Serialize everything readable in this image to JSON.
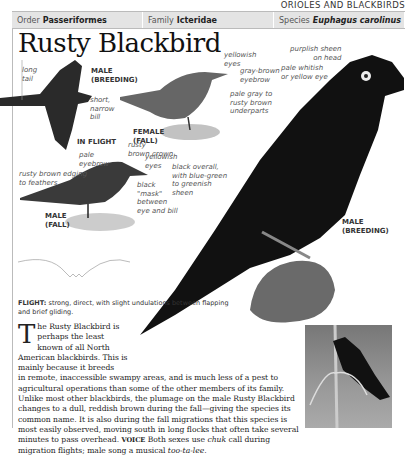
{
  "section": "ORIOLES AND BLACKBIRDS",
  "header": {
    "order_label": "Order",
    "order_value": "Passeriformes",
    "family_label": "Family",
    "family_value": "Icteridae",
    "species_label": "Species",
    "species_value": "Euphagus carolinus"
  },
  "title": "Rusty Blackbird",
  "captions": {
    "flight_male": [
      "MALE",
      "(BREEDING)"
    ],
    "in_flight": "IN FLIGHT",
    "female_fall": [
      "FEMALE",
      "(FALL)"
    ],
    "male_fall": [
      "MALE",
      "(FALL)"
    ],
    "male_breeding": [
      "MALE",
      "(BREEDING)"
    ]
  },
  "annotations": {
    "long_tail": [
      "long",
      "tail"
    ],
    "short_bill": [
      "short,",
      "narrow",
      "bill"
    ],
    "yellowish_eyes_female": [
      "yellowish",
      "eyes"
    ],
    "gray_brown_eyebrow": [
      "gray-brown",
      "eyebrow"
    ],
    "pale_gray_underparts": [
      "pale gray to",
      "rusty brown",
      "underparts"
    ],
    "purplish_sheen": [
      "purplish sheen",
      "on head"
    ],
    "pale_eye": [
      "pale whitish",
      "or yellow eye"
    ],
    "rusty_crown": [
      "rusty",
      "brown crown"
    ],
    "pale_eyebrow": [
      "pale",
      "eyebrow"
    ],
    "yellowish_eyes_male": [
      "yellowish",
      "eyes"
    ],
    "rusty_edging": [
      "rusty brown edging",
      "to feathers"
    ],
    "black_mask": [
      "black",
      "\"mask\"",
      "between",
      "eye and bill"
    ],
    "black_overall": [
      "black overall,",
      "with blue-green",
      "to greenish",
      "sheen"
    ]
  },
  "flight_note": {
    "label": "FLIGHT:",
    "text": " strong, direct, with slight undulations between flapping and brief gliding."
  },
  "body": {
    "dropcap": "T",
    "first_lines": "he Rusty Blackbird is perhaps the least known of all North American blackbirds. This is mainly because it breeds",
    "rest": "in remote, inaccessible swampy areas, and is much less of a pest to agricultural operations than some of the other members of its family. Unlike most other blackbirds, the plumage on the male Rusty Blackbird changes to a dull, reddish brown during the fall—giving the species its common name. It is also during the fall migrations that this species is most easily observed, moving south in long flocks that often take several minutes to pass overhead.",
    "voice_label": "VOICE",
    "voice_text_1": " Both sexes use ",
    "voice_call": "chuk",
    "voice_text_2": " call during migration flights; male song a musical ",
    "voice_song": "too-ta-lee",
    "voice_end": "."
  }
}
